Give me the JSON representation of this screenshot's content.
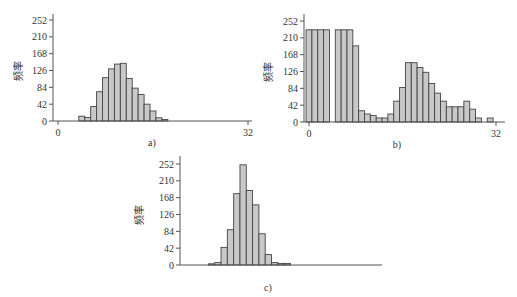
{
  "chart_data": [
    {
      "id": "a",
      "type": "bar",
      "title": "",
      "panel_label": "a)",
      "xlabel": "",
      "ylabel": "频率",
      "xlim": [
        0,
        32
      ],
      "ylim": [
        0,
        252
      ],
      "xticks": [
        0,
        32
      ],
      "yticks": [
        0,
        42,
        84,
        126,
        168,
        210,
        252
      ],
      "grid": false,
      "x": [
        4,
        5,
        6,
        7,
        8,
        9,
        10,
        11,
        12,
        13,
        14,
        15,
        16,
        17,
        18
      ],
      "values": [
        12,
        9,
        36,
        73,
        108,
        130,
        142,
        144,
        106,
        82,
        66,
        42,
        25,
        8,
        4
      ]
    },
    {
      "id": "b",
      "type": "bar",
      "title": "",
      "panel_label": "b)",
      "xlabel": "",
      "ylabel": "频率",
      "xlim": [
        0,
        32
      ],
      "ylim": [
        0,
        252
      ],
      "xticks": [
        0,
        32
      ],
      "yticks": [
        0,
        42,
        84,
        126,
        168,
        210,
        252
      ],
      "grid": false,
      "x": [
        0,
        1,
        2,
        3,
        4,
        5,
        6,
        7,
        8,
        9,
        10,
        11,
        12,
        13,
        14,
        15,
        16,
        17,
        18,
        19,
        20,
        21,
        22,
        23,
        24,
        25,
        26,
        27,
        28,
        29,
        30,
        31
      ],
      "values": [
        230,
        230,
        230,
        230,
        0,
        230,
        230,
        230,
        190,
        28,
        20,
        16,
        10,
        10,
        20,
        52,
        86,
        148,
        148,
        136,
        124,
        96,
        72,
        52,
        38,
        38,
        38,
        52,
        32,
        10,
        0,
        10
      ]
    },
    {
      "id": "c",
      "type": "bar",
      "title": "",
      "panel_label": "c)",
      "xlabel": "",
      "ylabel": "频率",
      "xlim": [
        0,
        32
      ],
      "ylim": [
        0,
        252
      ],
      "xticks": [],
      "yticks": [
        0,
        42,
        84,
        126,
        168,
        210,
        252
      ],
      "grid": false,
      "x": [
        5,
        6,
        7,
        8,
        9,
        10,
        11,
        12,
        13,
        14,
        15,
        16,
        17
      ],
      "values": [
        3,
        6,
        44,
        88,
        178,
        250,
        186,
        150,
        78,
        26,
        6,
        4,
        4
      ]
    }
  ]
}
